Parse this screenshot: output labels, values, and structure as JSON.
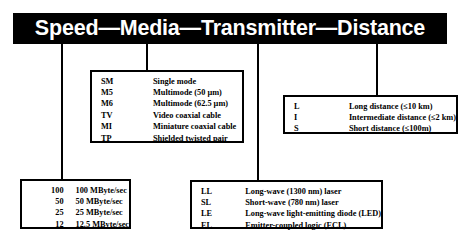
{
  "banner": {
    "title": "Speed—Media—Transmitter—Distance",
    "segments": [
      "Speed",
      "Media",
      "Transmitter",
      "Distance"
    ],
    "background_color": "#000000",
    "text_color": "#ffffff"
  },
  "media": {
    "rows": [
      {
        "code": "SM",
        "description": "Single mode"
      },
      {
        "code": "M5",
        "description": "Multimode (50 µm)"
      },
      {
        "code": "M6",
        "description": "Multimode (62.5 µm)"
      },
      {
        "code": "TV",
        "description": "Video coaxial cable"
      },
      {
        "code": "MI",
        "description": "Miniature coaxial cable"
      },
      {
        "code": "TP",
        "description": "Shielded twisted pair"
      }
    ]
  },
  "distance": {
    "rows": [
      {
        "code": "L",
        "description": "Long distance (≤10 km)"
      },
      {
        "code": "I",
        "description": "Intermediate distance (≤2 km)"
      },
      {
        "code": "S",
        "description": "Short distance (≤100m)"
      }
    ]
  },
  "speed": {
    "rows": [
      {
        "code": "100",
        "description": "100 MByte/sec"
      },
      {
        "code": "50",
        "description": "50 MByte/sec"
      },
      {
        "code": "25",
        "description": "25 MByte/sec"
      },
      {
        "code": "12",
        "description": "12.5 MByte/sec"
      }
    ]
  },
  "transmitter": {
    "rows": [
      {
        "code": "LL",
        "description": "Long-wave (1300 nm) laser"
      },
      {
        "code": "SL",
        "description": "Short-wave (780 nm) laser"
      },
      {
        "code": "LE",
        "description": "Long-wave light-emitting diode (LED)"
      },
      {
        "code": "EL",
        "description": "Emitter-coupled logic (ECL)"
      }
    ]
  },
  "colors": {
    "line": "#000000",
    "box_border": "#000000",
    "background": "#ffffff"
  }
}
